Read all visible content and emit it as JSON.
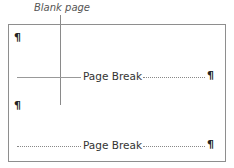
{
  "callout": {
    "label": "Blank page"
  },
  "document": {
    "paragraph_mark": "¶",
    "page_breaks": [
      {
        "label": "Page Break",
        "left_line_style": "solid",
        "right_line_style": "dotted"
      },
      {
        "label": "Page Break",
        "left_line_style": "dotted",
        "right_line_style": "dotted"
      }
    ]
  },
  "colors": {
    "border": "#8e8e8e",
    "leader_line": "#8a8a8a",
    "text": "#333333"
  }
}
